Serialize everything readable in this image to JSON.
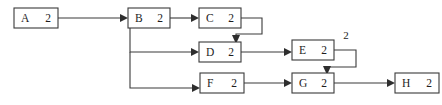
{
  "diagram": {
    "type": "directed-graph",
    "background_color": "#ffffff",
    "stroke_color": "#3a3a3a",
    "text_color": "#1d1d1d",
    "nodes": [
      {
        "id": "A",
        "letter": "A",
        "count": "2",
        "x": 14,
        "y": 8,
        "w": 44,
        "h": 20
      },
      {
        "id": "B",
        "letter": "B",
        "count": "2",
        "x": 128,
        "y": 8,
        "w": 42,
        "h": 20
      },
      {
        "id": "C",
        "letter": "C",
        "count": "2",
        "x": 199,
        "y": 8,
        "w": 42,
        "h": 20
      },
      {
        "id": "D",
        "letter": "D",
        "count": "2",
        "x": 199,
        "y": 42,
        "w": 42,
        "h": 20
      },
      {
        "id": "E",
        "letter": "E",
        "count": "2",
        "x": 292,
        "y": 40,
        "w": 42,
        "h": 20
      },
      {
        "id": "F",
        "letter": "F",
        "count": "2",
        "x": 200,
        "y": 73,
        "w": 44,
        "h": 20
      },
      {
        "id": "G",
        "letter": "G",
        "count": "2",
        "x": 292,
        "y": 73,
        "w": 42,
        "h": 20
      },
      {
        "id": "H",
        "letter": "H",
        "count": "2",
        "x": 395,
        "y": 73,
        "w": 44,
        "h": 20
      }
    ],
    "edges": [
      {
        "id": "a-to-b",
        "from": "A",
        "to": "B",
        "path": "M 58 18 L 124 18",
        "arrow": {
          "x": 128,
          "y": 18,
          "dir": "right"
        }
      },
      {
        "id": "b-to-c",
        "from": "B",
        "to": "C",
        "path": "M 170 18 L 195 18",
        "arrow": {
          "x": 199,
          "y": 18,
          "dir": "right"
        }
      },
      {
        "id": "b-branch-to-d",
        "from": "B",
        "to": "D",
        "path": "M 130 28 L 130 52 L 195 52",
        "arrow": {
          "x": 199,
          "y": 52,
          "dir": "right"
        }
      },
      {
        "id": "b-branch-to-f",
        "from": "B",
        "to": "F",
        "path": "M 130 52 L 130 88 L 196 88",
        "arrow": {
          "x": 200,
          "y": 88,
          "dir": "right"
        }
      },
      {
        "id": "c-loop-to-d",
        "from": "C",
        "to": "D",
        "path": "M 241 18 L 262 18 L 262 34 L 236 34 L 236 40",
        "arrow": {
          "x": 236,
          "y": 44,
          "dir": "down"
        }
      },
      {
        "id": "d-to-e",
        "from": "D",
        "to": "E",
        "path": "M 241 52 L 288 52",
        "arrow": {
          "x": 292,
          "y": 52,
          "dir": "right"
        }
      },
      {
        "id": "e-loop-to-g",
        "from": "E",
        "to": "G",
        "path": "M 334 50 L 356 50 L 356 67 L 327 67 L 327 70",
        "arrow": {
          "x": 327,
          "y": 74,
          "dir": "down"
        }
      },
      {
        "id": "f-to-g",
        "from": "F",
        "to": "G",
        "path": "M 244 83 L 288 83",
        "arrow": {
          "x": 292,
          "y": 83,
          "dir": "right"
        }
      },
      {
        "id": "g-to-h",
        "from": "G",
        "to": "H",
        "path": "M 334 83 L 391 83",
        "arrow": {
          "x": 395,
          "y": 83,
          "dir": "right"
        }
      }
    ],
    "edge_labels": [
      {
        "id": "e-loop-label",
        "text": "2",
        "x": 346,
        "y": 36
      }
    ]
  }
}
